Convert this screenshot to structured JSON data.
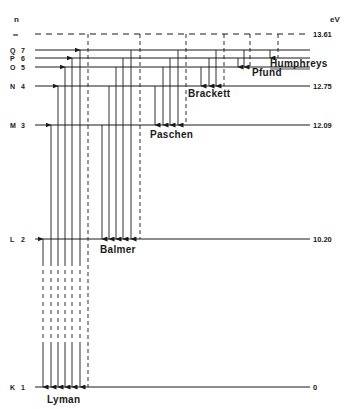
{
  "diagram": {
    "title_left": "n",
    "title_right": "eV",
    "levels": [
      {
        "shell": "",
        "n": "∞",
        "energy": "13.61",
        "dashed": true
      },
      {
        "shell": "Q",
        "n": "7",
        "energy": ""
      },
      {
        "shell": "P",
        "n": "6",
        "energy": ""
      },
      {
        "shell": "O",
        "n": "5",
        "energy": ""
      },
      {
        "shell": "N",
        "n": "4",
        "energy": "12.75"
      },
      {
        "shell": "M",
        "n": "3",
        "energy": "12.09"
      },
      {
        "shell": "L",
        "n": "2",
        "energy": "10.20"
      },
      {
        "shell": "K",
        "n": "1",
        "energy": "0"
      }
    ],
    "series": [
      {
        "name": "Lyman",
        "lower_n": 1,
        "upper_n": [
          2,
          3,
          4,
          5,
          6,
          7
        ],
        "limit": "∞"
      },
      {
        "name": "Balmer",
        "lower_n": 2,
        "upper_n": [
          3,
          4,
          5,
          6,
          7
        ],
        "limit": "∞"
      },
      {
        "name": "Paschen",
        "lower_n": 3,
        "upper_n": [
          4,
          5,
          6,
          7
        ],
        "limit": "∞"
      },
      {
        "name": "Brackett",
        "lower_n": 4,
        "upper_n": [
          5,
          6,
          7
        ],
        "limit": "∞"
      },
      {
        "name": "Pfund",
        "lower_n": 5,
        "upper_n": [
          6,
          7
        ],
        "limit": "∞"
      },
      {
        "name": "Humphreys",
        "lower_n": 6,
        "upper_n": [
          7
        ],
        "limit": "∞"
      }
    ]
  }
}
